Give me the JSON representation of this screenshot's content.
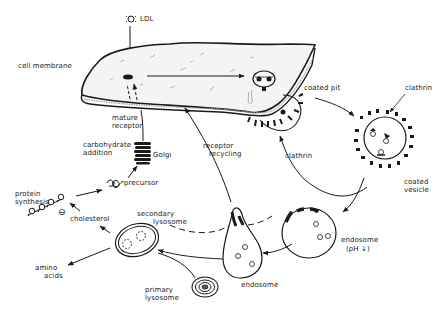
{
  "diagram": {
    "colors": {
      "ink": "#1a1a1a",
      "background": "#ffffff",
      "membrane_fill": "#f4f4f4"
    },
    "labels": {
      "ldl": "LDL",
      "cell_membrane": "cell membrane",
      "coated_pit": "coated pit",
      "clathrin_top": "clathrin",
      "clathrin_mid": "clathrin",
      "coated_vesicle_1": "coated",
      "coated_vesicle_2": "vesicle",
      "mature_receptor_1": "mature",
      "mature_receptor_2": "receptor",
      "carbohydrate_1": "carbohydrate",
      "carbohydrate_2": "addition",
      "golgi": "Golgi",
      "precursor": "precursor",
      "protein_synthesis_1": "protein",
      "protein_synthesis_2": "synthesis",
      "inhibit": "⊖",
      "cholesterol": "cholesterol",
      "secondary_lysosome_1": "secondary",
      "secondary_lysosome_2": "lysosome",
      "amino_acids_1": "amino",
      "amino_acids_2": "acids",
      "primary_lysosome_1": "primary",
      "primary_lysosome_2": "lysosome",
      "receptor_recycling_1": "receptor",
      "receptor_recycling_2": "recycling",
      "endosome_left": "endosome",
      "endosome_right": "endosome",
      "endosome_ph": "(pH ↓)"
    }
  }
}
